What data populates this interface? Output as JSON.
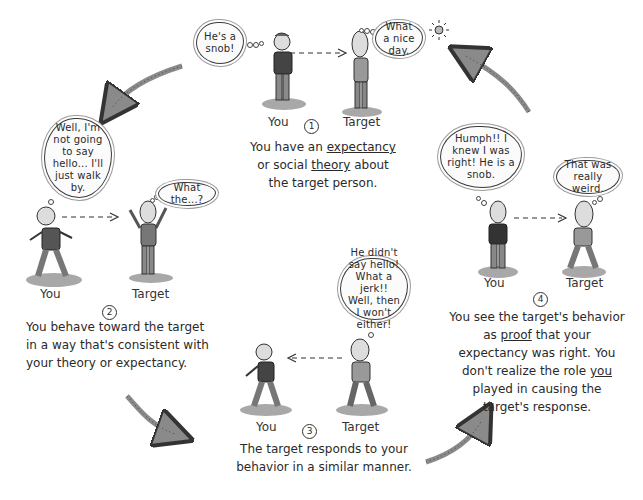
{
  "diagram": {
    "type": "cycle",
    "topic": "self-fulfilling prophecy",
    "steps": [
      {
        "number": "1",
        "actors": {
          "you": "You",
          "target": "Target"
        },
        "you_thought": "He's a snob!",
        "target_thought": "What a nice day.",
        "arrow_direction": "you-to-target",
        "caption_parts": [
          "You have an ",
          "expectancy",
          " or social ",
          "theory",
          " about the target person."
        ],
        "underlined": [
          "expectancy",
          "theory"
        ]
      },
      {
        "number": "2",
        "actors": {
          "you": "You",
          "target": "Target"
        },
        "you_thought": "Well, I'm not going to say hello... I'll just walk by.",
        "target_thought": "What the...?",
        "arrow_direction": "you-to-target",
        "caption": [
          "You behave toward the target",
          "in a way that's consistent with",
          "your theory or expectancy."
        ]
      },
      {
        "number": "3",
        "actors": {
          "you": "You",
          "target": "Target"
        },
        "target_thought": "He didn't say hello! What a jerk!! Well, then I won't either!",
        "arrow_direction": "target-to-you",
        "caption": [
          "The target responds to your",
          "behavior in a similar manner."
        ]
      },
      {
        "number": "4",
        "actors": {
          "you": "You",
          "target": "Target"
        },
        "you_thought": "Humph!! I knew I was right! He is a snob.",
        "target_thought": "That was really weird.",
        "arrow_direction": "you-to-target",
        "caption_parts": [
          "You see the target's behavior as ",
          "proof",
          " that your expectancy was right. You don't realize the role ",
          "you",
          " played in causing the target's response."
        ],
        "underlined": [
          "proof",
          "you",
          "is"
        ]
      }
    ],
    "cycle_arrows": [
      {
        "from": "1",
        "to": "2"
      },
      {
        "from": "2",
        "to": "3"
      },
      {
        "from": "3",
        "to": "4"
      },
      {
        "from": "4",
        "to": "1"
      }
    ],
    "colors": {
      "ink": "#2a2a2a",
      "shade": "#8a8a8a",
      "grass": "#a8a8a8",
      "paper": "#ffffff"
    }
  }
}
